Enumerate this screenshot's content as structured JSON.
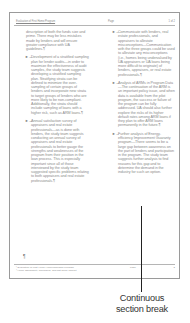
{
  "page": {
    "header": {
      "left": "Evaluation of First Home Program",
      "center": "Page",
      "right": "1 of 2"
    },
    "left_column": [
      {
        "type": "para",
        "text": "description of both the funds size and prime. There may be less mistakes made by lenders and will ensure greater compliance with UA guidelines.¶"
      },
      {
        "type": "bullet",
        "marker": "►→",
        "text": "Development of a stratified sampling plan for lender audits—in order to maximize the effectiveness of audit samples, the study team suggests developing a stratified sampling plan. Stratifying strata can be defined to minimize the over-sampling of certain groups of lenders and incorporate new strata to target groups of lenders who are more likely to be non-compliant. Additionally, the strata should include sampling of loans with a higher risk, such as ARM loans.¶"
      },
      {
        "type": "bullet",
        "marker": "►→",
        "text": "Annual satisfaction survey of appraisers and real estate professionals—as is done with lenders, the study team suggests conducting an annual survey of appraisers and real estate professionals to better gauge the strengths and weaknesses of the program from their position in the loan process. This is especially important since all of those interviewed by the study team suggested specific problems relating to both appraisers and real estate professionals.¶"
      }
    ],
    "right_column": [
      {
        "type": "bullet",
        "marker": "►→",
        "text": "Communicate with lenders, real estate professionals, and appraisers to alleviate misconceptions—Communication with the three groups could be used to alleviate any misconceptions (i.e., homes being undervalued by UA appraisers or UA loans being more difficult to originate) of lenders, appraisers, or real estate professionals.¶"
      },
      {
        "type": "bullet",
        "marker": "►→",
        "text": "Analysis of ARMs in Program Data—The continuation of the ARM is an important policy issue, and when data is available from the pilot program, the success or failure of the program can be fully addressed. UA should also further explore the risks of its higher default rates among ARM loans if they plan to offer ARM loans permanently in the future.¶"
      },
      {
        "type": "bullet",
        "marker": "►→",
        "text": "Further analysis of Energy-efficiency Improvement Guaranty program—There seems to be a large gap between awareness on the part of lenders and participation in the program. The study team suggests further analysis to find reasons for this gap and to determine the demand in the industry for such an option."
      }
    ],
    "pilcrow": "¶",
    "footer": {
      "footnotes": [
        "¹ Evaluation of First Home Homeownership Program",
        "² Home affordability, appraisers, and first home rapport"
      ],
      "page_label": "Page",
      "page_number": "2"
    }
  },
  "callout": {
    "caption_line1": "Continuous",
    "caption_line2": "section break"
  }
}
